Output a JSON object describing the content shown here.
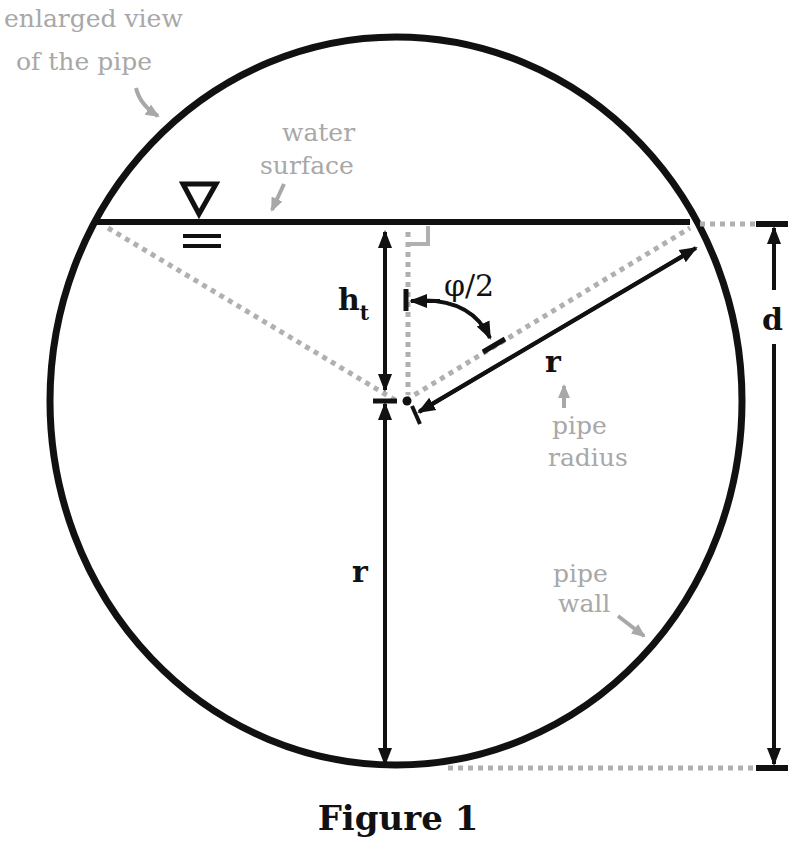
{
  "figure": {
    "caption": "Figure 1",
    "annotations": {
      "enlarged_view_line1": "enlarged view",
      "enlarged_view_line2": "of the pipe",
      "water_surface_line1": "water",
      "water_surface_line2": "surface",
      "pipe_radius_line1": "pipe",
      "pipe_radius_line2": "radius",
      "pipe_wall_line1": "pipe",
      "pipe_wall_line2": "wall"
    },
    "symbols": {
      "depth": "h",
      "depth_subscript": "t",
      "half_angle": "φ/2",
      "radius_upper": "r",
      "radius_lower": "r",
      "diameter": "d"
    },
    "colors": {
      "line": "#111111",
      "annotation": "#a8a8a8",
      "dotted": "#b0b0b0"
    }
  }
}
